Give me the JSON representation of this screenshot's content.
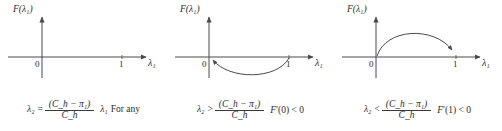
{
  "figure": {
    "type": "math-figure",
    "panel_count": 3,
    "axis": {
      "y_label": "F(λ₁)",
      "x_label": "λ₁",
      "ticks": [
        "0",
        "1"
      ],
      "origin_tick": "0",
      "unit_tick": "1"
    },
    "colors": {
      "ink": "#2b2b2b",
      "axis": "#4a4a4a",
      "curve": "#4a4a4a",
      "background": "#ffffff"
    }
  },
  "panels": [
    {
      "id": "panel-flat",
      "curve": "none",
      "curve_description": "no curve drawn; F identically along axis",
      "condition": {
        "lhs": "λ₂",
        "relation": "=",
        "numerator": "(C_h − π₁)",
        "denominator": "C_h"
      },
      "note": {
        "symbol": "λ₁",
        "text": "For any"
      }
    },
    {
      "id": "panel-concave-up",
      "curve": "below-axis-arc",
      "curve_description": "arc dipping below the axis from x=1 to x=0 with arrowhead at origin",
      "condition": {
        "lhs": "λ₂",
        "relation": ">",
        "numerator": "(C_h − π₁)",
        "denominator": "C_h"
      },
      "derivative": {
        "symbol": "F",
        "prime": "′",
        "argument": "(0)",
        "relation": "<",
        "value": "0"
      }
    },
    {
      "id": "panel-concave-down",
      "curve": "above-axis-arc",
      "curve_description": "arc rising above the axis from x=0 peaking and descending with arrowhead at x=1",
      "condition": {
        "lhs": "λ₂",
        "relation": "<",
        "numerator": "(C_h − π₁)",
        "denominator": "C_h"
      },
      "derivative": {
        "symbol": "F",
        "prime": "′",
        "argument": "(1)",
        "relation": "<",
        "value": "0"
      }
    }
  ]
}
